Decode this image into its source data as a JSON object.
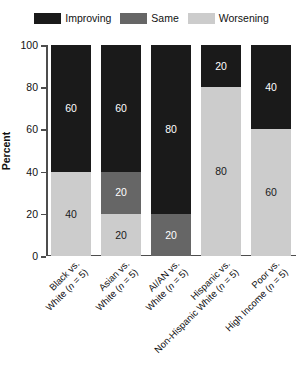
{
  "chart_data": {
    "type": "bar",
    "subtype": "stacked-bar-100",
    "title": "",
    "xlabel": "",
    "ylabel": "Percent",
    "ylim": [
      0,
      100
    ],
    "yticks": [
      0,
      20,
      40,
      60,
      80,
      100
    ],
    "grid": false,
    "legend_position": "top-center",
    "categories": [
      "Black vs. White (n = 5)",
      "Asian vs. White (n = 5)",
      "AI/AN vs. White (n = 5)",
      "Hispanic vs. Non-Hispanic White (n = 5)",
      "Poor vs. High Income (n = 5)"
    ],
    "category_lines": [
      [
        "Black vs.",
        "White (n = 5)"
      ],
      [
        "Asian vs.",
        "White (n = 5)"
      ],
      [
        "AI/AN vs.",
        "White (n = 5)"
      ],
      [
        "Hispanic vs.",
        "Non-Hispanic White (n = 5)"
      ],
      [
        "Poor vs.",
        "High Income (n = 5)"
      ]
    ],
    "series": [
      {
        "name": "Improving",
        "color": "#1a1a1a",
        "label_color": "#ffffff",
        "values": [
          60,
          60,
          80,
          20,
          40
        ]
      },
      {
        "name": "Same",
        "color": "#666666",
        "label_color": "#ffffff",
        "values": [
          0,
          20,
          20,
          0,
          0
        ]
      },
      {
        "name": "Worsening",
        "color": "#cccccc",
        "label_color": "#1a1a1a",
        "values": [
          40,
          20,
          0,
          80,
          60
        ]
      }
    ]
  },
  "legend": {
    "items": [
      {
        "label": "Improving",
        "color": "#1a1a1a"
      },
      {
        "label": "Same",
        "color": "#666666"
      },
      {
        "label": "Worsening",
        "color": "#cccccc"
      }
    ]
  },
  "axis": {
    "y_title": "Percent",
    "y_ticks": [
      "100",
      "80",
      "60",
      "40",
      "20",
      "0"
    ]
  }
}
